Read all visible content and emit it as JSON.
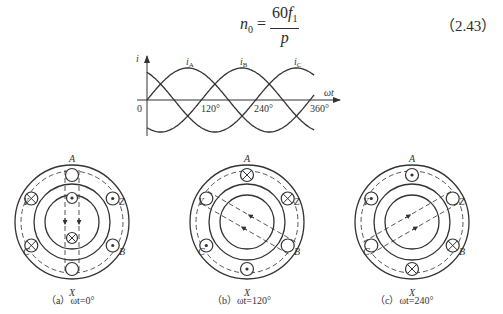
{
  "equation": {
    "lhs_var": "n",
    "lhs_sub": "0",
    "numerator_coef": "60",
    "numerator_var": "f",
    "numerator_sub": "1",
    "denominator": "p",
    "number": "（2.43）"
  },
  "waveform": {
    "y_label": "i",
    "x_label": "ωt",
    "origin_label": "0",
    "ticks": [
      "120°",
      "240°",
      "360°"
    ],
    "series_labels": [
      "i_A",
      "i_B",
      "i_C"
    ],
    "series_label_main": [
      "i",
      "i",
      "i"
    ],
    "series_label_sub": [
      "A",
      "B",
      "C"
    ]
  },
  "chart_data": {
    "type": "line",
    "title": "",
    "xlabel": "ωt",
    "ylabel": "i",
    "x": [
      0,
      30,
      60,
      90,
      120,
      150,
      180,
      210,
      240,
      270,
      300,
      330,
      360
    ],
    "series": [
      {
        "name": "i_A",
        "values": [
          0,
          0.5,
          0.87,
          1,
          0.87,
          0.5,
          0,
          -0.5,
          -0.87,
          -1,
          -0.87,
          -0.5,
          0
        ]
      },
      {
        "name": "i_B",
        "values": [
          -0.87,
          -1,
          -0.87,
          -0.5,
          0,
          0.5,
          0.87,
          1,
          0.87,
          0.5,
          0,
          -0.5,
          -0.87
        ]
      },
      {
        "name": "i_C",
        "values": [
          0.87,
          0.5,
          0,
          -0.5,
          -0.87,
          -1,
          -0.87,
          -0.5,
          0,
          0.5,
          0.87,
          1,
          0.87
        ]
      }
    ],
    "xticks": [
      "0",
      "120°",
      "240°",
      "360°"
    ],
    "ylim": [
      -1,
      1
    ],
    "grid": false
  },
  "stator_diagrams": [
    {
      "caption": "（a）ωt=0°",
      "slot_labels": {
        "A": "A",
        "X": "X",
        "Y": "Y",
        "Z": "Z",
        "B": "B",
        "C": "C"
      },
      "slots": {
        "A": "empty",
        "X": "empty",
        "Y": "cross",
        "Z": "dot",
        "C": "cross",
        "B": "dot"
      },
      "field_angle_deg": 90
    },
    {
      "caption": "（b）ωt=120°",
      "slot_labels": {
        "A": "A",
        "X": "X",
        "Y": "Y",
        "Z": "Z",
        "B": "B",
        "C": "C"
      },
      "slots": {
        "A": "cross",
        "X": "dot",
        "Y": "empty",
        "Z": "cross",
        "C": "dot",
        "B": "empty"
      },
      "field_angle_deg": -30
    },
    {
      "caption": "（c）ωt=240°",
      "slot_labels": {
        "A": "A",
        "X": "X",
        "Y": "Y",
        "Z": "Z",
        "B": "B",
        "C": "C"
      },
      "slots": {
        "A": "dot",
        "X": "cross",
        "Y": "dot",
        "Z": "empty",
        "C": "empty",
        "B": "cross"
      },
      "field_angle_deg": 210
    }
  ]
}
